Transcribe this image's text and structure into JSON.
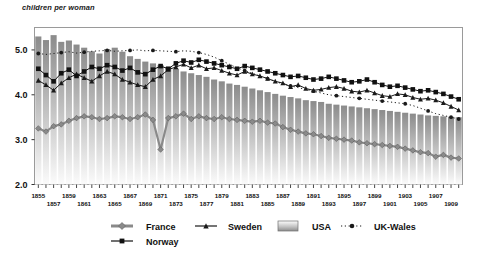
{
  "chart_data": {
    "type": "line",
    "title": "children per woman",
    "xlabel": "",
    "ylabel": "children per woman",
    "ylim": [
      2.0,
      5.5
    ],
    "y_ticks": [
      2.0,
      3.0,
      4.0,
      5.0
    ],
    "y_tick_labels": [
      "2.0",
      "3.0",
      "4.0",
      "5.0"
    ],
    "grid": false,
    "legend_position": "bottom",
    "x": [
      1855,
      1856,
      1857,
      1858,
      1859,
      1860,
      1861,
      1862,
      1863,
      1864,
      1865,
      1866,
      1867,
      1868,
      1869,
      1870,
      1871,
      1872,
      1873,
      1874,
      1875,
      1876,
      1877,
      1878,
      1879,
      1880,
      1881,
      1882,
      1883,
      1884,
      1885,
      1886,
      1887,
      1888,
      1889,
      1890,
      1891,
      1892,
      1893,
      1894,
      1895,
      1896,
      1897,
      1898,
      1899,
      1900,
      1901,
      1902,
      1903,
      1904,
      1905,
      1906,
      1907,
      1908,
      1909,
      1910
    ],
    "x_tick_labels_upper": [
      "1855",
      "1859",
      "1863",
      "1867",
      "1871",
      "1875",
      "1879",
      "1883",
      "1887",
      "1891",
      "1895",
      "1899",
      "1903",
      "1907"
    ],
    "x_tick_labels_lower": [
      "1857",
      "1861",
      "1865",
      "1869",
      "1873",
      "1877",
      "1881",
      "1885",
      "1889",
      "1893",
      "1897",
      "1901",
      "1905",
      "1909"
    ],
    "series": [
      {
        "name": "USA",
        "type": "bar",
        "marker": "bar-gradient",
        "color": "#8c8c8c",
        "values": [
          5.3,
          5.22,
          5.33,
          5.18,
          5.21,
          5.12,
          5.05,
          4.97,
          4.92,
          5.02,
          5.05,
          4.96,
          4.86,
          4.8,
          4.74,
          4.7,
          4.66,
          4.62,
          4.58,
          4.52,
          4.48,
          4.44,
          4.4,
          4.34,
          4.3,
          4.25,
          4.22,
          4.18,
          4.14,
          4.1,
          4.06,
          4.02,
          3.98,
          3.95,
          3.92,
          3.88,
          3.86,
          3.84,
          3.8,
          3.78,
          3.76,
          3.74,
          3.72,
          3.7,
          3.68,
          3.66,
          3.64,
          3.62,
          3.6,
          3.58,
          3.56,
          3.54,
          3.53,
          3.52,
          3.51,
          3.5
        ]
      },
      {
        "name": "France",
        "type": "line",
        "marker": "diamond",
        "color": "#8a8a8a",
        "values": [
          3.25,
          3.18,
          3.3,
          3.34,
          3.42,
          3.48,
          3.52,
          3.5,
          3.46,
          3.48,
          3.52,
          3.5,
          3.46,
          3.5,
          3.56,
          3.44,
          2.78,
          3.48,
          3.52,
          3.58,
          3.46,
          3.52,
          3.48,
          3.46,
          3.5,
          3.46,
          3.44,
          3.42,
          3.4,
          3.42,
          3.38,
          3.36,
          3.28,
          3.22,
          3.18,
          3.14,
          3.12,
          3.08,
          3.04,
          3.02,
          3.0,
          2.98,
          2.94,
          2.92,
          2.9,
          2.88,
          2.86,
          2.84,
          2.8,
          2.76,
          2.72,
          2.7,
          2.62,
          2.66,
          2.6,
          2.58
        ]
      },
      {
        "name": "Sweden",
        "type": "line",
        "marker": "triangle",
        "color": "#1a1a1a",
        "values": [
          4.32,
          4.22,
          4.1,
          4.26,
          4.38,
          4.46,
          4.38,
          4.3,
          4.42,
          4.52,
          4.46,
          4.34,
          4.28,
          4.22,
          4.18,
          4.34,
          4.42,
          4.56,
          4.62,
          4.68,
          4.6,
          4.66,
          4.58,
          4.6,
          4.54,
          4.48,
          4.44,
          4.52,
          4.46,
          4.42,
          4.36,
          4.3,
          4.26,
          4.18,
          4.22,
          4.14,
          4.1,
          4.12,
          4.16,
          4.18,
          4.14,
          4.08,
          4.06,
          4.1,
          4.04,
          3.98,
          3.96,
          4.02,
          4.0,
          3.94,
          3.9,
          3.92,
          3.88,
          3.82,
          3.74,
          3.66
        ]
      },
      {
        "name": "UK-Wales",
        "type": "line",
        "marker": "circle-dotted",
        "color": "#1a1a1a",
        "values": [
          4.92,
          4.9,
          4.92,
          4.94,
          4.96,
          4.93,
          4.95,
          4.97,
          4.98,
          4.99,
          4.97,
          4.98,
          4.99,
          5.0,
          4.98,
          4.99,
          4.98,
          4.97,
          4.96,
          4.98,
          4.97,
          4.94,
          4.9,
          4.84,
          4.76,
          4.68,
          4.6,
          4.54,
          4.48,
          4.42,
          4.36,
          4.3,
          4.24,
          4.2,
          4.16,
          4.12,
          4.08,
          4.04,
          4.0,
          3.98,
          3.96,
          3.94,
          3.92,
          3.9,
          3.88,
          3.86,
          3.84,
          3.82,
          3.8,
          3.76,
          3.7,
          3.64,
          3.58,
          3.54,
          3.5,
          3.46
        ]
      },
      {
        "name": "Norway",
        "type": "line",
        "marker": "square",
        "color": "#111111",
        "values": [
          4.58,
          4.44,
          4.3,
          4.48,
          4.56,
          4.42,
          4.52,
          4.62,
          4.58,
          4.66,
          4.62,
          4.54,
          4.6,
          4.5,
          4.46,
          4.56,
          4.64,
          4.58,
          4.7,
          4.76,
          4.72,
          4.78,
          4.74,
          4.7,
          4.66,
          4.62,
          4.58,
          4.64,
          4.6,
          4.56,
          4.52,
          4.48,
          4.44,
          4.4,
          4.42,
          4.38,
          4.34,
          4.36,
          4.4,
          4.36,
          4.32,
          4.28,
          4.3,
          4.34,
          4.28,
          4.22,
          4.18,
          4.2,
          4.16,
          4.12,
          4.08,
          4.1,
          4.06,
          4.02,
          3.96,
          3.9
        ]
      }
    ]
  },
  "legend": {
    "items": [
      {
        "label": "France",
        "key": "france"
      },
      {
        "label": "Sweden",
        "key": "sweden"
      },
      {
        "label": "USA",
        "key": "usa"
      },
      {
        "label": "UK-Wales",
        "key": "uk-wales"
      },
      {
        "label": "Norway",
        "key": "norway"
      }
    ]
  }
}
